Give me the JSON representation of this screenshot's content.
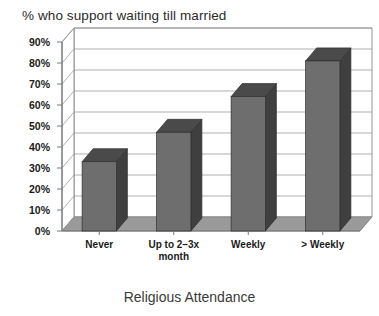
{
  "chart_data": {
    "type": "bar",
    "title": "% who support waiting till married",
    "xlabel": "Religious Attendance",
    "ylabel": "",
    "categories": [
      "Never",
      "Up to 2–3x\nmonth",
      "Weekly",
      "> Weekly"
    ],
    "values": [
      33,
      47,
      64,
      81
    ],
    "ytick_labels": [
      "0%",
      "10%",
      "20%",
      "30%",
      "40%",
      "50%",
      "60%",
      "70%",
      "80%",
      "90%"
    ],
    "ytick_values": [
      0,
      10,
      20,
      30,
      40,
      50,
      60,
      70,
      80,
      90
    ],
    "ylim": [
      0,
      90
    ],
    "grid": true,
    "legend": false,
    "style": "3d-column",
    "colors": {
      "bar_front": "#6e6e6e",
      "bar_top": "#4a4a4a",
      "bar_side": "#3f3f3f",
      "floor": "#9a9a9a",
      "wall": "#ffffff",
      "gridline": "#9c9c9c",
      "axis": "#7a7a7a",
      "text": "#1a1a1a",
      "background": "#ffffff"
    }
  }
}
